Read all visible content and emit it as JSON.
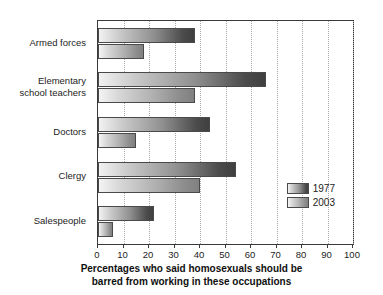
{
  "chart_data": {
    "type": "bar",
    "orientation": "horizontal",
    "title": "",
    "xlabel": "Percentages who said homosexuals should be barred from working in these occupations",
    "ylabel": "",
    "xlim": [
      0,
      100
    ],
    "xticks": [
      0,
      10,
      20,
      30,
      40,
      50,
      60,
      70,
      80,
      90,
      100
    ],
    "xtick_labels": [
      "0",
      "10",
      "20",
      "30",
      "40",
      "50",
      "60",
      "70",
      "80",
      "90",
      "100"
    ],
    "grid": true,
    "grid_axis": "x",
    "legend_position": "lower right",
    "categories": [
      "Armed forces",
      "Elementary school teachers",
      "Doctors",
      "Clergy",
      "Salespeople"
    ],
    "series": [
      {
        "name": "1977",
        "color": "#4c4c4c",
        "values": [
          38,
          66,
          44,
          54,
          22
        ]
      },
      {
        "name": "2003",
        "color": "#8d8d8d",
        "values": [
          18,
          38,
          15,
          40,
          6
        ]
      }
    ]
  },
  "axis_title": {
    "line1": "Percentages who said homosexuals should be",
    "line2": "barred from working in these occupations"
  },
  "category_labels": [
    "Armed forces",
    "Elementary\nschool teachers",
    "Doctors",
    "Clergy",
    "Salespeople"
  ],
  "legend": {
    "items": [
      {
        "label": "1977"
      },
      {
        "label": "2003"
      }
    ]
  }
}
